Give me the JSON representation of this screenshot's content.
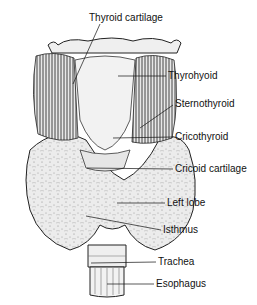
{
  "figure": {
    "labels": [
      {
        "id": "thyroid-cartilage",
        "text": "Thyroid cartilage",
        "x": 89,
        "y": 17
      },
      {
        "id": "thyrohyoid",
        "text": "Thyrohyoid",
        "x": 168,
        "y": 70
      },
      {
        "id": "sternothyroid",
        "text": "Sternothyroid",
        "x": 175,
        "y": 98
      },
      {
        "id": "cricothyroid",
        "text": "Cricothyroid",
        "x": 175,
        "y": 131
      },
      {
        "id": "cricoid-cartilage",
        "text": "Cricoid cartilage",
        "x": 175,
        "y": 163
      },
      {
        "id": "left-lobe",
        "text": "Left lobe",
        "x": 167,
        "y": 197
      },
      {
        "id": "isthmus",
        "text": "Isthmus",
        "x": 163,
        "y": 224
      },
      {
        "id": "trachea",
        "text": "Trachea",
        "x": 158,
        "y": 255
      },
      {
        "id": "esophagus",
        "text": "Esophagus",
        "x": 156,
        "y": 277
      }
    ]
  }
}
